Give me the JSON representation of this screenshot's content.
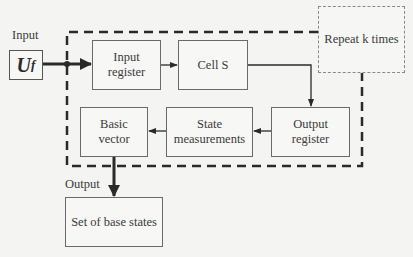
{
  "input": {
    "label": "Input",
    "symbol_main": "U",
    "symbol_sub": "f"
  },
  "output": {
    "label": "Output"
  },
  "blocks": {
    "input_register": "Input\nregister",
    "cell_s": "Cell S",
    "output_register": "Output\nregister",
    "state_measurements": "State\nmeasurements",
    "basic_vector": "Basic\nvector",
    "set_of_base_states": "Set of base states"
  },
  "loop": {
    "label": "Repeat k times"
  },
  "colors": {
    "line": "#2a2a2a",
    "box_border": "#6a6a6a",
    "background": "#f4f4f2"
  }
}
